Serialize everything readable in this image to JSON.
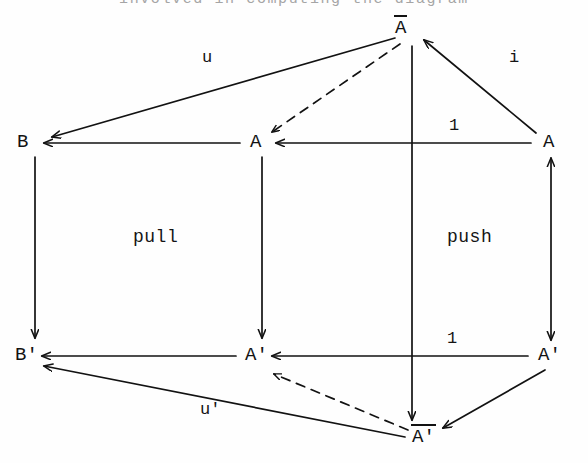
{
  "page": {
    "width": 588,
    "height": 463,
    "background": "#fefefe",
    "ink": "#121212",
    "clipped_top_text": "involved in computing the diagram"
  },
  "diagram": {
    "type": "commutative-cube-diagram",
    "nodes": [
      {
        "id": "A-bar-top",
        "label": "A",
        "overline": true,
        "prime": false,
        "x": 405,
        "y": 30,
        "text": "Ā"
      },
      {
        "id": "B-top",
        "label": "B",
        "overline": false,
        "prime": false,
        "x": 24,
        "y": 142,
        "text": "B"
      },
      {
        "id": "A-mid-center",
        "label": "A",
        "overline": false,
        "prime": false,
        "x": 256,
        "y": 142,
        "text": "A"
      },
      {
        "id": "A-mid-right",
        "label": "A",
        "overline": false,
        "prime": false,
        "x": 548,
        "y": 142,
        "text": "A"
      },
      {
        "id": "B-prime",
        "label": "B'",
        "overline": false,
        "prime": true,
        "x": 22,
        "y": 355,
        "text": "B'"
      },
      {
        "id": "A-prime-center",
        "label": "A'",
        "overline": false,
        "prime": true,
        "x": 252,
        "y": 355,
        "text": "A'"
      },
      {
        "id": "A-prime-right",
        "label": "A'",
        "overline": false,
        "prime": true,
        "x": 545,
        "y": 355,
        "text": "A'"
      },
      {
        "id": "A-bar-prime-bottom",
        "label": "A'",
        "overline": true,
        "prime": true,
        "x": 420,
        "y": 437,
        "text": "Ā'"
      }
    ],
    "edge_labels": [
      {
        "id": "label-u",
        "text": "u",
        "x": 208,
        "y": 58,
        "edge": "A-bar-top -> B-top"
      },
      {
        "id": "label-i",
        "text": "i",
        "x": 512,
        "y": 58,
        "edge": "A-mid-right -> A-bar-top"
      },
      {
        "id": "label-one-top",
        "text": "1",
        "x": 454,
        "y": 126,
        "edge": "A-mid-right -> A-mid-center"
      },
      {
        "id": "label-one-bottom",
        "text": "1",
        "x": 452,
        "y": 339,
        "edge": "A-prime-right -> A-prime-center"
      },
      {
        "id": "label-u-prime",
        "text": "u'",
        "x": 208,
        "y": 410,
        "edge": "A-bar-prime-bottom -> B-prime"
      }
    ],
    "region_labels": [
      {
        "id": "label-pull",
        "text": "pull",
        "x": 155,
        "y": 237
      },
      {
        "id": "label-push",
        "text": "push",
        "x": 470,
        "y": 237
      }
    ],
    "edges": [
      {
        "id": "edge-u",
        "from": "A-bar-top",
        "to": "B-top",
        "style": "solid",
        "arrow": "end",
        "label": "u"
      },
      {
        "id": "edge-i",
        "from": "A-mid-right",
        "to": "A-bar-top",
        "style": "solid",
        "arrow": "end",
        "label": "i"
      },
      {
        "id": "edge-one-top",
        "from": "A-mid-right",
        "to": "A-mid-center",
        "style": "solid",
        "arrow": "end",
        "label": "1"
      },
      {
        "id": "edge-dashed-top",
        "from": "A-bar-top",
        "to": "A-mid-center",
        "style": "dashed",
        "arrow": "end",
        "label": ""
      },
      {
        "id": "edge-b-vertical",
        "from": "B-top",
        "to": "B-prime",
        "style": "solid",
        "arrow": "end",
        "label": ""
      },
      {
        "id": "edge-a-center-vertical",
        "from": "A-mid-center",
        "to": "A-prime-center",
        "style": "solid",
        "arrow": "end",
        "label": ""
      },
      {
        "id": "edge-abar-vertical",
        "from": "A-bar-top",
        "to": "A-bar-prime-bottom",
        "style": "solid",
        "arrow": "end",
        "label": ""
      },
      {
        "id": "edge-a-right-vertical",
        "from": "A-mid-right",
        "to": "A-prime-right",
        "style": "solid",
        "arrow": "both",
        "label": ""
      },
      {
        "id": "edge-one-bottom",
        "from": "A-prime-right",
        "to": "A-prime-center",
        "style": "solid",
        "arrow": "end",
        "label": "1"
      },
      {
        "id": "edge-u-prime",
        "from": "A-bar-prime-bottom",
        "to": "B-prime",
        "style": "solid",
        "arrow": "end",
        "label": "u'"
      },
      {
        "id": "edge-i-prime",
        "from": "A-prime-right",
        "to": "A-bar-prime-bottom",
        "style": "solid",
        "arrow": "end",
        "label": ""
      },
      {
        "id": "edge-dashed-bottom",
        "from": "A-bar-prime-bottom",
        "to": "A-prime-center",
        "style": "dashed",
        "arrow": "end",
        "label": ""
      }
    ]
  }
}
